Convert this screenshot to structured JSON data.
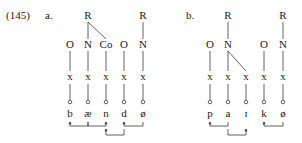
{
  "example_number": "(145)",
  "panels": [
    {
      "label": "a.",
      "roots": [
        {
          "label": "R",
          "column": 1,
          "children": [
            1,
            2
          ]
        },
        {
          "label": "R",
          "column": 4,
          "children": [
            4
          ]
        }
      ],
      "nodes": [
        "O",
        "N",
        "Co",
        "O",
        "N"
      ],
      "skeleton": [
        "x",
        "x",
        "x",
        "x",
        "x"
      ],
      "segments": [
        "b",
        "æ",
        "n",
        "d",
        "ø"
      ],
      "arrows": [
        {
          "from": 1,
          "to": 0,
          "level": 1
        },
        {
          "from": 1,
          "to": 2,
          "level": 1
        },
        {
          "from": 3,
          "to": 2,
          "level": 2
        },
        {
          "from": 4,
          "to": 3,
          "level": 1
        }
      ]
    },
    {
      "label": "b.",
      "roots": [
        {
          "label": "R",
          "column": 1,
          "children": [
            1
          ]
        },
        {
          "label": "R",
          "column": 4,
          "children": [
            4
          ]
        }
      ],
      "nodes": [
        "O",
        "N",
        "",
        "O",
        "N"
      ],
      "nucleus_links": [
        {
          "node": 1,
          "to_x": 2
        }
      ],
      "skeleton": [
        "x",
        "x",
        "x",
        "x",
        "x"
      ],
      "segments": [
        "p",
        "a",
        "ɪ",
        "k",
        "ø"
      ],
      "arrows": [
        {
          "from": 1,
          "to": 0,
          "level": 1
        },
        {
          "from": 1,
          "to": 2,
          "level": 2
        },
        {
          "from": 4,
          "to": 3,
          "level": 1
        }
      ]
    }
  ]
}
